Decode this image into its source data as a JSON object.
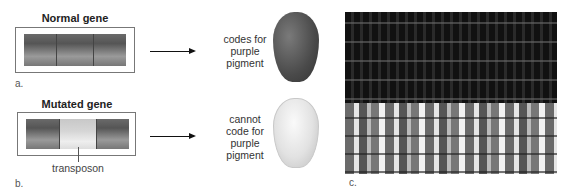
{
  "panels": {
    "a": {
      "title": "Normal gene",
      "label": "a.",
      "outcome": [
        "codes for",
        "purple",
        "pigment"
      ],
      "kernel_color": "#555555"
    },
    "b": {
      "title": "Mutated gene",
      "label": "b.",
      "insert_label": "transposon",
      "outcome": [
        "cannot",
        "code for",
        "purple",
        "pigment"
      ],
      "kernel_color": "#e0e0e0"
    },
    "c": {
      "label": "c.",
      "description": "photo of corn cob with dark purple kernels (top) and mottled variegated kernels (bottom)"
    }
  }
}
